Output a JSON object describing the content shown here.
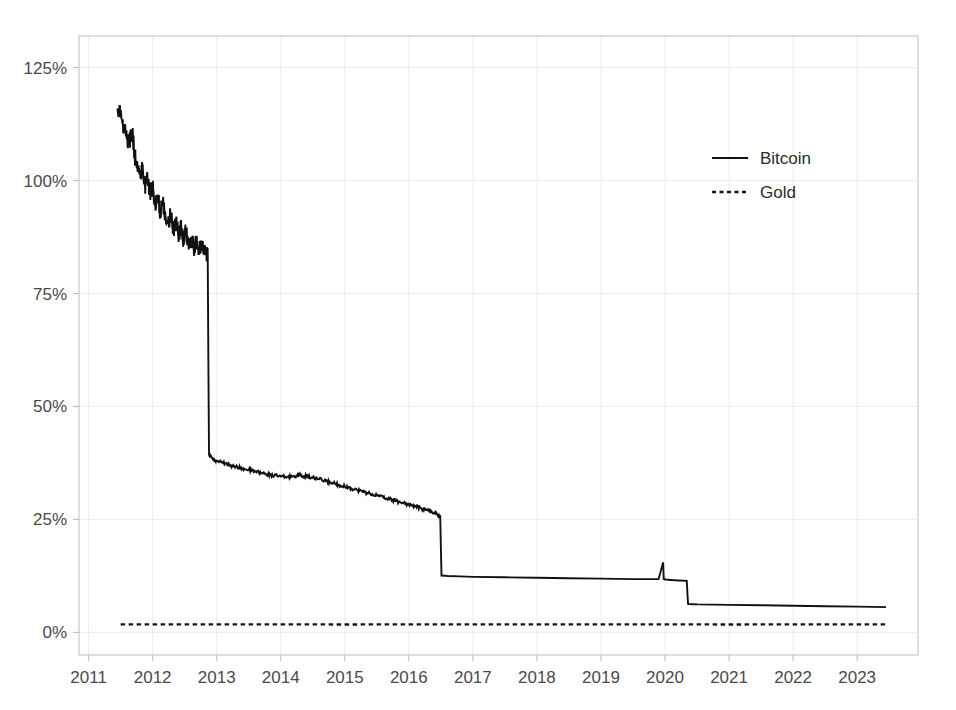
{
  "figure": {
    "title": "",
    "caption": ""
  },
  "axes": {
    "y": {
      "label": "",
      "ticks": [
        "0%",
        "25%",
        "50%",
        "75%",
        "100%",
        "125%"
      ],
      "tick_values": [
        0,
        25,
        50,
        75,
        100,
        125
      ],
      "min": -5,
      "max": 132
    },
    "x": {
      "label": "",
      "ticks": [
        "2011",
        "2012",
        "2013",
        "2014",
        "2015",
        "2016",
        "2017",
        "2018",
        "2019",
        "2020",
        "2021",
        "2022",
        "2023"
      ],
      "tick_values": [
        2011,
        2012,
        2013,
        2014,
        2015,
        2016,
        2017,
        2018,
        2019,
        2020,
        2021,
        2022,
        2023
      ],
      "min": 2010.85,
      "max": 2023.95
    }
  },
  "legend": {
    "position": "upper-right",
    "entries": [
      {
        "label": "Bitcoin",
        "style": "solid",
        "color": "#111111"
      },
      {
        "label": "Gold",
        "style": "dotted",
        "color": "#141414"
      }
    ]
  },
  "colors": {
    "bitcoin": "#111111",
    "gold": "#141414",
    "grid": "#ededed",
    "frame": "#c9c9c9",
    "text": "#4a4a4a",
    "background": "#ffffff"
  },
  "chart_data": {
    "type": "line",
    "title": "",
    "xlabel": "",
    "ylabel": "",
    "xlim": [
      2010.85,
      2023.95
    ],
    "ylim": [
      -5,
      132
    ],
    "grid": true,
    "legend_position": "upper-right",
    "series": [
      {
        "name": "Bitcoin",
        "style": "solid",
        "color": "#111111",
        "note": "Annual supply inflation rate; step drops at halvings (late 2012, mid 2016, mid 2020)",
        "x": [
          2011.45,
          2011.52,
          2011.58,
          2011.63,
          2011.68,
          2011.72,
          2011.76,
          2011.8,
          2011.84,
          2011.88,
          2011.92,
          2011.96,
          2012.0,
          2012.04,
          2012.08,
          2012.12,
          2012.16,
          2012.2,
          2012.24,
          2012.28,
          2012.32,
          2012.36,
          2012.4,
          2012.44,
          2012.48,
          2012.52,
          2012.56,
          2012.6,
          2012.64,
          2012.68,
          2012.72,
          2012.76,
          2012.8,
          2012.84,
          2012.86,
          2012.87,
          2012.88,
          2012.92,
          2012.96,
          2013.0,
          2013.1,
          2013.2,
          2013.3,
          2013.4,
          2013.5,
          2013.6,
          2013.7,
          2013.8,
          2013.9,
          2014.0,
          2014.1,
          2014.2,
          2014.3,
          2014.4,
          2014.5,
          2014.6,
          2014.7,
          2014.8,
          2014.9,
          2015.0,
          2015.1,
          2015.2,
          2015.3,
          2015.4,
          2015.5,
          2015.6,
          2015.7,
          2015.8,
          2015.9,
          2016.0,
          2016.1,
          2016.2,
          2016.3,
          2016.4,
          2016.49,
          2016.5,
          2016.51,
          2016.6,
          2016.8,
          2017.0,
          2017.5,
          2018.0,
          2018.5,
          2019.0,
          2019.5,
          2019.9,
          2019.97,
          2019.98,
          2020.0,
          2020.1,
          2020.2,
          2020.34,
          2020.35,
          2020.36,
          2020.5,
          2021.0,
          2021.5,
          2022.0,
          2022.5,
          2023.0,
          2023.45
        ],
        "y": [
          116.0,
          113.5,
          110.0,
          108.5,
          111.0,
          105.5,
          104.0,
          101.5,
          103.0,
          99.0,
          100.5,
          97.0,
          98.5,
          95.0,
          96.5,
          93.0,
          95.5,
          92.0,
          90.5,
          92.5,
          89.0,
          90.5,
          88.0,
          89.5,
          87.0,
          88.5,
          86.0,
          87.5,
          85.0,
          86.5,
          84.5,
          85.5,
          84.0,
          83.5,
          83.2,
          60.0,
          39.5,
          38.8,
          38.2,
          38.0,
          37.5,
          37.0,
          36.6,
          36.3,
          36.0,
          35.6,
          35.3,
          35.0,
          34.7,
          34.5,
          34.4,
          34.6,
          34.8,
          34.5,
          34.2,
          33.9,
          33.5,
          33.1,
          32.7,
          32.3,
          31.9,
          31.5,
          31.1,
          30.7,
          30.3,
          29.9,
          29.5,
          29.1,
          28.7,
          28.3,
          27.9,
          27.4,
          27.0,
          26.5,
          25.7,
          19.0,
          12.6,
          12.5,
          12.4,
          12.3,
          12.2,
          12.1,
          12.0,
          11.9,
          11.8,
          11.8,
          15.5,
          11.8,
          11.7,
          11.6,
          11.5,
          11.4,
          8.5,
          6.3,
          6.2,
          6.1,
          6.0,
          5.9,
          5.8,
          5.7,
          5.6
        ]
      },
      {
        "name": "Gold",
        "style": "dotted",
        "color": "#141414",
        "note": "Roughly constant ~1.7% annual supply growth",
        "x": [
          2011.5,
          2013.0,
          2015.0,
          2017.0,
          2019.0,
          2021.0,
          2023.45
        ],
        "y": [
          1.8,
          1.8,
          1.75,
          1.8,
          1.8,
          1.75,
          1.8
        ]
      }
    ]
  }
}
